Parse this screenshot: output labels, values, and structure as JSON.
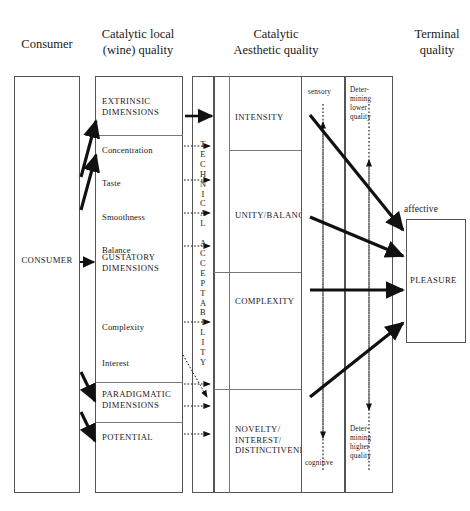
{
  "figure": {
    "headers": [
      {
        "text": "Consumer",
        "x": 14,
        "y": 36,
        "w": 66
      },
      {
        "text": "Catalytic local\n(wine) quality",
        "x": 88,
        "y": 26,
        "w": 100
      },
      {
        "text": "Catalytic\nAesthetic quality",
        "x": 215,
        "y": 26,
        "w": 120
      },
      {
        "text": "Terminal\nquality",
        "x": 400,
        "y": 26,
        "w": 70
      }
    ],
    "consumer": {
      "box": {
        "x": 14,
        "y": 76,
        "w": 66,
        "h": 417
      },
      "label": "CONSUMER",
      "label_y": 255
    },
    "wine_quality": {
      "box": {
        "x": 95,
        "y": 76,
        "w": 88,
        "h": 417
      },
      "dividers_y": [
        135,
        382,
        422
      ],
      "rows": [
        {
          "label": "EXTRINSIC\nDIMENSIONS",
          "y": 96,
          "caps": true
        },
        {
          "label": "Concentration",
          "y": 145,
          "caps": false
        },
        {
          "label": "Taste",
          "y": 178,
          "caps": false
        },
        {
          "label": "Smoothness",
          "y": 212,
          "caps": false
        },
        {
          "label": "Balance",
          "y": 245,
          "caps": false
        },
        {
          "label": "GUSTATORY\nDIMENSIONS",
          "y": 252,
          "caps": true
        },
        {
          "label": "Complexity",
          "y": 322,
          "caps": false
        },
        {
          "label": "Interest",
          "y": 358,
          "caps": false
        },
        {
          "label": "PARADIGMATIC\nDIMENSIONS",
          "y": 389,
          "caps": true
        },
        {
          "label": "POTENTIAL",
          "y": 432,
          "caps": true
        }
      ]
    },
    "technical_acceptability": {
      "box": {
        "x": 192,
        "y": 76,
        "w": 22,
        "h": 417
      },
      "letters": [
        "T",
        "E",
        "C",
        "H",
        "N",
        "I",
        "C",
        "A",
        "L",
        "",
        "A",
        "C",
        "C",
        "E",
        "P",
        "T",
        "A",
        "B",
        "I",
        "L",
        "I",
        "T",
        "Y"
      ],
      "start_y": 140
    },
    "aesthetic_quality": {
      "box": {
        "x": 214,
        "y": 76,
        "w": 106,
        "h": 417
      },
      "inner_vline_x": 229,
      "dividers_y": [
        150,
        272,
        389
      ],
      "rows": [
        {
          "label": "INTENSITY",
          "y": 112
        },
        {
          "label": "UNITY/BALANCE",
          "y": 210
        },
        {
          "label": "COMPLEXITY",
          "y": 296
        },
        {
          "label": "NOVELTY/\nINTEREST/\nDISTINCTIVENESS",
          "y": 424
        }
      ]
    },
    "sensory_column": {
      "box": {
        "x": 301,
        "y": 76,
        "w": 44,
        "h": 417
      },
      "top_label": "sensory",
      "top_label_y": 88,
      "bottom_label": "cognitive",
      "bottom_label_y": 459
    },
    "determining_column": {
      "box": {
        "x": 345,
        "y": 76,
        "w": 48,
        "h": 417
      },
      "top_label": "Deter-\nmining\nlower\nquality",
      "top_label_y": 86,
      "bottom_label": "Deter-\nmining\nhigher\nquality",
      "bottom_label_y": 425
    },
    "pleasure": {
      "box": {
        "x": 406,
        "y": 219,
        "w": 60,
        "h": 124
      },
      "label": "PLEASURE",
      "label_y": 275,
      "affective_label": "affective",
      "affective_x": 404,
      "affective_y": 204
    },
    "colors": {
      "stroke": "#1a1a1a",
      "box_border": "#555555",
      "divider": "#777777",
      "background": "#ffffff"
    },
    "arrows": {
      "solid_thick": [
        {
          "name": "consumer-to-extrinsic",
          "x1": 81,
          "y1": 175,
          "x2": 96,
          "y2": 120
        },
        {
          "name": "consumer-to-concentration",
          "x1": 81,
          "y1": 208,
          "x2": 96,
          "y2": 152
        },
        {
          "name": "consumer-to-gustatory",
          "x1": 81,
          "y1": 262,
          "x2": 95,
          "y2": 262
        },
        {
          "name": "consumer-to-paradigmatic",
          "x1": 81,
          "y1": 371,
          "x2": 96,
          "y2": 400
        },
        {
          "name": "consumer-to-potential",
          "x1": 81,
          "y1": 410,
          "x2": 96,
          "y2": 440
        },
        {
          "name": "extrinsic-to-intensity",
          "x1": 185,
          "y1": 116,
          "x2": 214,
          "y2": 116
        },
        {
          "name": "intensity-to-pleasure",
          "x1": 311,
          "y1": 116,
          "x2": 404,
          "y2": 231
        },
        {
          "name": "unity-to-pleasure",
          "x1": 311,
          "y1": 216,
          "x2": 404,
          "y2": 254
        },
        {
          "name": "complexity-to-pleasure",
          "x1": 311,
          "y1": 289,
          "x2": 404,
          "y2": 289
        },
        {
          "name": "novelty-to-pleasure",
          "x1": 311,
          "y1": 397,
          "x2": 404,
          "y2": 320
        }
      ],
      "dotted": [
        {
          "name": "concentration-to-ta",
          "x1": 184,
          "y1": 146,
          "x2": 213,
          "y2": 146
        },
        {
          "name": "taste-to-ta",
          "x1": 184,
          "y1": 180,
          "x2": 213,
          "y2": 180
        },
        {
          "name": "smoothness-to-ta",
          "x1": 184,
          "y1": 213,
          "x2": 213,
          "y2": 213
        },
        {
          "name": "balance-to-ta",
          "x1": 184,
          "y1": 246,
          "x2": 213,
          "y2": 246
        },
        {
          "name": "complexity-to-ta",
          "x1": 184,
          "y1": 322,
          "x2": 213,
          "y2": 322
        },
        {
          "name": "paradigmatic-to-ta",
          "x1": 184,
          "y1": 384,
          "x2": 213,
          "y2": 384
        },
        {
          "name": "paradigmatic2-to-ta",
          "x1": 184,
          "y1": 406,
          "x2": 213,
          "y2": 406
        },
        {
          "name": "potential-to-ta",
          "x1": 184,
          "y1": 434,
          "x2": 213,
          "y2": 434
        },
        {
          "name": "interest-to-acceptability",
          "x1": 184,
          "y1": 357,
          "x2": 209,
          "y2": 398
        }
      ],
      "dotted_vertical": [
        {
          "name": "sensory-up-arrow",
          "x": 323,
          "y1": 470,
          "y2": 121,
          "dir": "up"
        },
        {
          "name": "determining-lower-up-arrow",
          "x": 369,
          "y1": 470,
          "y2": 158,
          "dir": "up"
        },
        {
          "name": "cognitive-down-arrow",
          "x": 323,
          "y1": 104,
          "y2": 440,
          "dir": "down"
        },
        {
          "name": "determining-higher-down-arrow",
          "x": 369,
          "y1": 104,
          "y2": 412,
          "dir": "down"
        }
      ]
    }
  }
}
